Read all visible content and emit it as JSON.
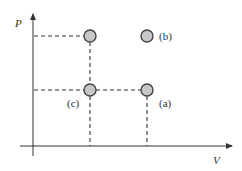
{
  "diagram": {
    "type": "P-V state diagram",
    "axes": {
      "y_label": "P",
      "x_label": "V"
    },
    "points": [
      {
        "id": "top-left",
        "label": "",
        "v": "V1",
        "p": "P2"
      },
      {
        "id": "b",
        "label": "(b)",
        "v": "V2",
        "p": "P2"
      },
      {
        "id": "c",
        "label": "(c)",
        "v": "V1",
        "p": "P1"
      },
      {
        "id": "a",
        "label": "(a)",
        "v": "V2",
        "p": "P1"
      }
    ],
    "colors": {
      "point_fill": "#c8c8c8",
      "point_stroke": "#444444",
      "line": "#333333"
    }
  }
}
